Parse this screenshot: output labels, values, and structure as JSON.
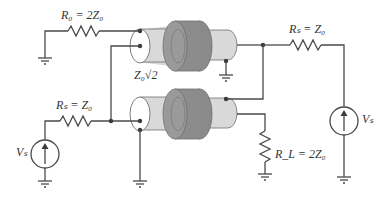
{
  "diagram": {
    "labels": {
      "r0": "R₀ = 2Z₀",
      "rs_left": "Rₛ = Z₀",
      "rs_right": "Rₛ = Z₀",
      "rl": "R_L = 2Z₀",
      "z_coax": "Z₀√2",
      "vs_left": "Vₛ",
      "vs_right": "Vₛ"
    },
    "components": [
      {
        "id": "R0",
        "type": "resistor",
        "label": "R0 = 2Z0"
      },
      {
        "id": "RS_left",
        "type": "resistor",
        "label": "RS = Z0"
      },
      {
        "id": "RS_right",
        "type": "resistor",
        "label": "RS = Z0"
      },
      {
        "id": "RL",
        "type": "resistor",
        "label": "RL = 2Z0"
      },
      {
        "id": "VS_left",
        "type": "voltage-source",
        "label": "VS"
      },
      {
        "id": "VS_right",
        "type": "voltage-source",
        "label": "VS"
      },
      {
        "id": "coax_top",
        "type": "coaxial-cable-with-ferrite"
      },
      {
        "id": "coax_bottom",
        "type": "coaxial-cable-with-ferrite",
        "impedance": "Z0√2"
      }
    ],
    "colors": {
      "wire": "#4a4a4a",
      "coax_dielectric": "#d9d9d9",
      "ferrite": "#8c8c8c",
      "ferrite_edge": "#6e6e6e",
      "coax_face": "#ffffff"
    }
  }
}
